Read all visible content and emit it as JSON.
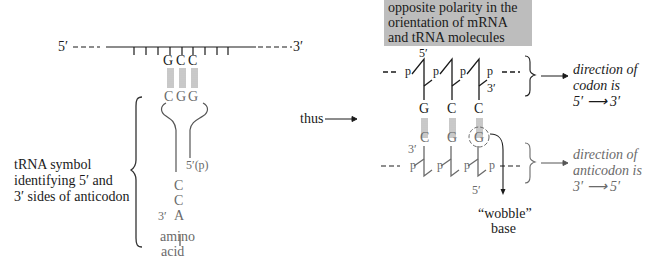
{
  "callout": {
    "lines": [
      "opposite polarity in the",
      "orientation of mRNA",
      "and tRNA molecules"
    ],
    "background": "#bdbdbd"
  },
  "left_diagram": {
    "mrna_5prime": "5′",
    "mrna_3prime": "3′",
    "codon_bases": [
      "G",
      "C",
      "C"
    ],
    "anticodon_bases": [
      "C",
      "G",
      "G"
    ],
    "trna_5p_label": "5′(p)",
    "cca_end": [
      "C",
      "C",
      "A"
    ],
    "trna_3prime": "3′",
    "amino_acid": [
      "amino",
      "acid"
    ],
    "description": [
      "tRNA symbol",
      "identifying 5′ and",
      "3′ sides of anticodon"
    ]
  },
  "connector": {
    "label": "thus"
  },
  "right_diagram": {
    "top_strand": {
      "label_5prime": "5′",
      "label_3prime": "3′",
      "phosphates": [
        "p",
        "p",
        "p",
        "p"
      ],
      "bases": [
        "G",
        "C",
        "C"
      ],
      "color": "#1a1a1a"
    },
    "bottom_strand": {
      "label_3prime": "3′",
      "label_5prime": "5′",
      "phosphates": [
        "p",
        "p",
        "p",
        "p"
      ],
      "bases": [
        "C",
        "G",
        "G"
      ],
      "color": "#6a6a6a"
    },
    "wobble_label": [
      "“wobble”",
      "base"
    ],
    "codon_direction": [
      "direction of",
      "codon is",
      "5′ ⟶ 3′"
    ],
    "anticodon_direction": [
      "direction of",
      "anticodon is",
      "3′ ⟶ 5′"
    ]
  }
}
